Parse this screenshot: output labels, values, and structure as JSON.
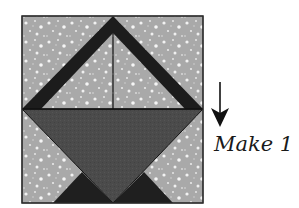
{
  "diagram": {
    "caption": "Make 1",
    "colors": {
      "background_fabric": "#a9a9a9",
      "fabric_dots": "#f2f2f2",
      "handle": "#1c1c1c",
      "basket": "#4b4b4b",
      "base_triangles": "#1f1f1f",
      "seam_lines": "#111111",
      "arrow": "#111111"
    },
    "pieces": [
      {
        "name": "handle-left-band",
        "shape": "parallelogram"
      },
      {
        "name": "handle-right-band",
        "shape": "parallelogram"
      },
      {
        "name": "basket-triangle",
        "shape": "triangle"
      },
      {
        "name": "base-triangle-left",
        "shape": "triangle"
      },
      {
        "name": "base-triangle-right",
        "shape": "triangle"
      }
    ],
    "arrow": {
      "direction": "down"
    }
  }
}
